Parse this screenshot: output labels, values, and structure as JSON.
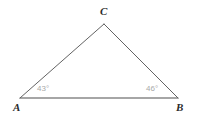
{
  "figure": {
    "type": "geometry-triangle-diagram",
    "background_color": "#ffffff",
    "stroke_color": "#5a5a5a",
    "stroke_width": 1,
    "label_color": "#2b2b2b",
    "angle_label_color": "#a9a9a9",
    "vertices": [
      {
        "name": "A",
        "label": "A",
        "x": 20,
        "y": 98
      },
      {
        "name": "B",
        "label": "B",
        "x": 178,
        "y": 98
      },
      {
        "name": "C",
        "label": "C",
        "x": 104,
        "y": 24
      }
    ],
    "sides": [
      {
        "name": "side-ab",
        "from": "A",
        "to": "B"
      },
      {
        "name": "side-ac",
        "from": "A",
        "to": "C"
      },
      {
        "name": "side-cb",
        "from": "C",
        "to": "B"
      }
    ],
    "angles": [
      {
        "at": "A",
        "label": "43°",
        "value": 43,
        "unit": "degrees"
      },
      {
        "at": "B",
        "label": "46°",
        "value": 46,
        "unit": "degrees"
      }
    ]
  }
}
